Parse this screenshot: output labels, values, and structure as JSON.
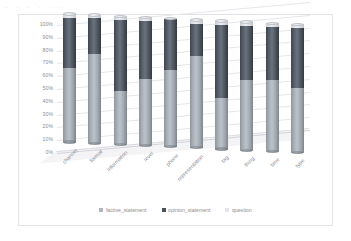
{
  "artifact_text": [
    "·",
    "·",
    "·",
    "·",
    "·",
    "·"
  ],
  "chart_data": {
    "type": "bar",
    "subtype": "stacked-100-percent-cylinder-3d",
    "title": "",
    "xlabel": "",
    "ylabel": "",
    "ylim": [
      0,
      100
    ],
    "ytick_labels": [
      "100%",
      "90%",
      "80%",
      "70%",
      "60%",
      "50%",
      "40%",
      "30%",
      "20%",
      "10%",
      "0%"
    ],
    "ytick_values": [
      100,
      90,
      80,
      70,
      60,
      50,
      40,
      30,
      20,
      10,
      0
    ],
    "grid": true,
    "legend_position": "bottom",
    "categories": [
      "channel",
      "format",
      "information",
      "level",
      "phone",
      "representation",
      "tag",
      "thing",
      "time",
      "type"
    ],
    "series": [
      {
        "name": "factive_statement",
        "color": "#b0b6be",
        "values": [
          58,
          70,
          42,
          52,
          60,
          72,
          40,
          55,
          56,
          50
        ]
      },
      {
        "name": "opinion_statement",
        "color": "#4a515b",
        "values": [
          39,
          28,
          55,
          45,
          40,
          25,
          57,
          42,
          41,
          47
        ]
      },
      {
        "name": "question",
        "color": "#e3e5e8",
        "values": [
          3,
          2,
          3,
          3,
          0,
          3,
          3,
          3,
          3,
          3
        ]
      }
    ]
  },
  "legend": {
    "items": [
      {
        "label": "factive_statement",
        "color": "#b0b6be"
      },
      {
        "label": "opinion_statement",
        "color": "#4a515b"
      },
      {
        "label": "question",
        "color": "#e3e5e8"
      }
    ]
  }
}
